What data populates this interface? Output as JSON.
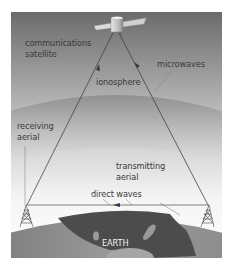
{
  "diagram": {
    "labels": {
      "satellite_line1": "communications",
      "satellite_line2": "satellite",
      "ionosphere": "ionosphere",
      "microwaves": "microwaves",
      "receiving_line1": "receiving",
      "receiving_line2": "aerial",
      "transmitting_line1": "transmitting",
      "transmitting_line2": "aerial",
      "direct_waves": "direct waves",
      "earth": "EARTH"
    },
    "colors": {
      "sky_top": "#6e6e6e",
      "sky_bottom": "#ffffff",
      "ionosphere": "#9a9a9a",
      "earth_land": "#8a8a8a",
      "earth_sea": "#4a4a4a",
      "beam": "#3c3c3c",
      "leader": "#8a8a8a"
    }
  }
}
